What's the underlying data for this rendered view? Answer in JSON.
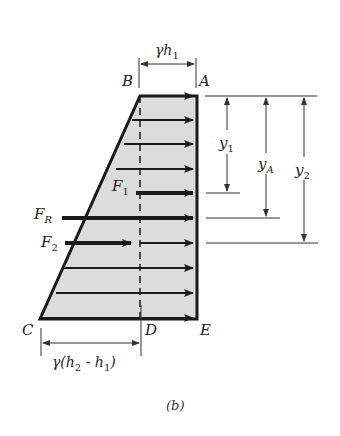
{
  "figure": {
    "caption": "(b)",
    "colors": {
      "fill": "#dcdcdc",
      "stroke": "#1a1a1a",
      "dim_line": "#333333",
      "background": "#ffffff"
    },
    "points": {
      "A": "A",
      "B": "B",
      "C": "C",
      "D": "D",
      "E": "E"
    },
    "dimensions": {
      "top_width": "γh",
      "top_width_sub": "1",
      "bottom_width": "γ(h",
      "bottom_width_sub2": "2",
      "bottom_width_mid": " - h",
      "bottom_width_sub1": "1",
      "bottom_width_end": ")"
    },
    "depths": {
      "y1": "y",
      "y1_sub": "1",
      "yA": "y",
      "yA_sub": "A",
      "y2": "y",
      "y2_sub": "2"
    },
    "forces": {
      "F1": "F",
      "F1_sub": "1",
      "FR": "F",
      "FR_sub": "R",
      "F2": "F",
      "F2_sub": "2"
    },
    "pressure_arrow_rows_y": [
      96,
      120,
      144,
      169,
      218,
      243,
      268,
      293,
      318
    ]
  }
}
